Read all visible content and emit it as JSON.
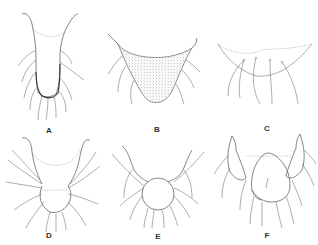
{
  "figure": {
    "panels": [
      {
        "label": "A",
        "shape": "narrow vase-shaped structure with two upturned horns, dark stippled lower margin and long setae"
      },
      {
        "label": "B",
        "shape": "broad triangular densely stippled structure with horned corners and long setae"
      },
      {
        "label": "C",
        "shape": "faint shallow curved outline with dotted upper margin and long curved setae"
      },
      {
        "label": "D",
        "shape": "U-shaped structure with dotted inner margin, rounded lower lobe and many setae"
      },
      {
        "label": "E",
        "shape": "flared structure with circular lower lobe and many setae"
      },
      {
        "label": "F",
        "shape": "two lateral horned lobes flanking a central rounded plate with setae"
      }
    ]
  }
}
